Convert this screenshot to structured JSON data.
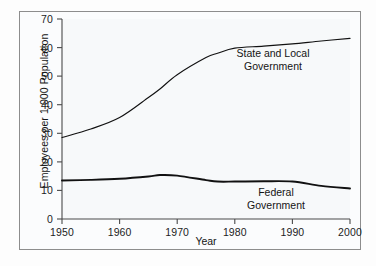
{
  "chart_data": {
    "type": "line",
    "title": "",
    "xlabel": "Year",
    "ylabel": "Employees per 1,000 Population",
    "xlim": [
      1950,
      2000
    ],
    "ylim": [
      0,
      70
    ],
    "xticks": [
      "1950",
      "1960",
      "1970",
      "1980",
      "1990",
      "2000"
    ],
    "yticks": [
      "0",
      "10",
      "20",
      "30",
      "40",
      "50",
      "60",
      "70"
    ],
    "grid": false,
    "legend_position": "inline-annotations",
    "annotations": [
      {
        "name": "state-and-local-government",
        "line1": "State and Local",
        "line2": "Government"
      },
      {
        "name": "federal-government",
        "line1": "Federal",
        "line2": "Government"
      }
    ],
    "x": [
      1950,
      1955,
      1960,
      1965,
      1967,
      1970,
      1975,
      1977,
      1980,
      1985,
      1990,
      1995,
      2000
    ],
    "series": [
      {
        "name": "State and Local Government",
        "values": [
          28.5,
          31.5,
          35.5,
          42.5,
          45.5,
          50.5,
          56.5,
          58.0,
          59.8,
          60.5,
          61.3,
          62.3,
          63.2
        ]
      },
      {
        "name": "Federal Government",
        "values": [
          13.5,
          13.7,
          14.1,
          14.9,
          15.4,
          15.2,
          13.6,
          13.1,
          13.1,
          13.2,
          13.1,
          11.6,
          10.7
        ]
      }
    ],
    "colors": {
      "line": "#111111",
      "axis": "#4a4a4a",
      "frame": "#8d8d8d",
      "plot_background": "#f7f9fa",
      "page_background": "#fdfdfd",
      "text": "#141414"
    }
  }
}
